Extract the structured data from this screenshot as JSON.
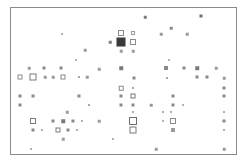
{
  "figure": {
    "type": "scatter",
    "title": "",
    "background_color": "#ffffff",
    "frame": {
      "x": 10,
      "y": 7,
      "width": 227,
      "height": 148,
      "border_color": "#8a8a8a",
      "border_width": 1,
      "fill": "#ffffff"
    },
    "marker_shape": "square",
    "palette": {
      "light": "#b9b9b9",
      "mid": "#9a9a9a",
      "dark": "#6e6e6e",
      "darkest": "#3a3a3a"
    },
    "axes": {
      "xlabel": "",
      "ylabel": "",
      "ticks_visible": false,
      "grid": false,
      "xlim": [
        0,
        227
      ],
      "ylim": [
        0,
        148
      ]
    },
    "legend": {
      "visible": false,
      "entries": []
    },
    "annotations": []
  },
  "chart_data": {
    "type": "scatter",
    "title": "",
    "xlabel": "",
    "ylabel": "",
    "xlim": [
      0,
      227
    ],
    "ylim": [
      0,
      148
    ],
    "grid": false,
    "legend_position": "none",
    "marker_shape": "square",
    "size_encodes": "magnitude",
    "note": "Grayscale square-marker scatter; marker side length encodes value, fill darkness encodes intensity. Coordinates are in plot-area pixels relative to the frame interior.",
    "points": [
      {
        "x": 134,
        "y": 9,
        "s": 2.5,
        "c": "#7a7a7a",
        "fill": "solid"
      },
      {
        "x": 190,
        "y": 8,
        "s": 3.0,
        "c": "#6e6e6e",
        "fill": "solid"
      },
      {
        "x": 160,
        "y": 20,
        "s": 2.5,
        "c": "#8a8a8a",
        "fill": "solid"
      },
      {
        "x": 51,
        "y": 26,
        "s": 2.0,
        "c": "#b0b0b0",
        "fill": "solid"
      },
      {
        "x": 110,
        "y": 25,
        "s": 6.0,
        "c": "#8a8a8a",
        "fill": "open"
      },
      {
        "x": 122,
        "y": 25,
        "s": 4.0,
        "c": "#9a9a9a",
        "fill": "open"
      },
      {
        "x": 150,
        "y": 26,
        "s": 2.5,
        "c": "#9a9a9a",
        "fill": "solid"
      },
      {
        "x": 176,
        "y": 26,
        "s": 2.5,
        "c": "#9a9a9a",
        "fill": "solid"
      },
      {
        "x": 99,
        "y": 34,
        "s": 2.5,
        "c": "#7a7a7a",
        "fill": "solid"
      },
      {
        "x": 110,
        "y": 34,
        "s": 9.0,
        "c": "#3a3a3a",
        "fill": "solid"
      },
      {
        "x": 122,
        "y": 34,
        "s": 6.0,
        "c": "#8a8a8a",
        "fill": "open"
      },
      {
        "x": 110,
        "y": 43,
        "s": 2.5,
        "c": "#9a9a9a",
        "fill": "solid"
      },
      {
        "x": 122,
        "y": 43,
        "s": 2.5,
        "c": "#9a9a9a",
        "fill": "solid"
      },
      {
        "x": 74,
        "y": 42,
        "s": 2.5,
        "c": "#9a9a9a",
        "fill": "solid"
      },
      {
        "x": 65,
        "y": 52,
        "s": 2.0,
        "c": "#b0b0b0",
        "fill": "solid"
      },
      {
        "x": 158,
        "y": 52,
        "s": 2.0,
        "c": "#b0b0b0",
        "fill": "solid"
      },
      {
        "x": 18,
        "y": 60,
        "s": 2.5,
        "c": "#9a9a9a",
        "fill": "solid"
      },
      {
        "x": 33,
        "y": 60,
        "s": 3.0,
        "c": "#8a8a8a",
        "fill": "solid"
      },
      {
        "x": 50,
        "y": 60,
        "s": 3.0,
        "c": "#8a8a8a",
        "fill": "solid"
      },
      {
        "x": 88,
        "y": 61,
        "s": 2.5,
        "c": "#9a9a9a",
        "fill": "solid"
      },
      {
        "x": 110,
        "y": 60,
        "s": 3.5,
        "c": "#7a7a7a",
        "fill": "solid"
      },
      {
        "x": 155,
        "y": 60,
        "s": 4.0,
        "c": "#8a8a8a",
        "fill": "solid"
      },
      {
        "x": 173,
        "y": 60,
        "s": 3.0,
        "c": "#8a8a8a",
        "fill": "solid"
      },
      {
        "x": 186,
        "y": 60,
        "s": 3.5,
        "c": "#7a7a7a",
        "fill": "solid"
      },
      {
        "x": 205,
        "y": 60,
        "s": 2.5,
        "c": "#9a9a9a",
        "fill": "solid"
      },
      {
        "x": 9,
        "y": 69,
        "s": 5.0,
        "c": "#8a8a8a",
        "fill": "open"
      },
      {
        "x": 22,
        "y": 69,
        "s": 7.0,
        "c": "#7a7a7a",
        "fill": "open"
      },
      {
        "x": 34,
        "y": 69,
        "s": 2.5,
        "c": "#9a9a9a",
        "fill": "solid"
      },
      {
        "x": 42,
        "y": 69,
        "s": 2.5,
        "c": "#9a9a9a",
        "fill": "solid"
      },
      {
        "x": 52,
        "y": 69,
        "s": 5.0,
        "c": "#8a8a8a",
        "fill": "open"
      },
      {
        "x": 68,
        "y": 69,
        "s": 2.0,
        "c": "#a8a8a8",
        "fill": "solid"
      },
      {
        "x": 76,
        "y": 69,
        "s": 2.5,
        "c": "#9a9a9a",
        "fill": "solid"
      },
      {
        "x": 123,
        "y": 70,
        "s": 3.0,
        "c": "#8a8a8a",
        "fill": "solid"
      },
      {
        "x": 156,
        "y": 70,
        "s": 2.0,
        "c": "#a8a8a8",
        "fill": "solid"
      },
      {
        "x": 186,
        "y": 69,
        "s": 3.0,
        "c": "#8a8a8a",
        "fill": "solid"
      },
      {
        "x": 196,
        "y": 69,
        "s": 3.0,
        "c": "#8a8a8a",
        "fill": "solid"
      },
      {
        "x": 213,
        "y": 70,
        "s": 2.5,
        "c": "#9a9a9a",
        "fill": "solid"
      },
      {
        "x": 110,
        "y": 80,
        "s": 4.5,
        "c": "#8a8a8a",
        "fill": "open"
      },
      {
        "x": 122,
        "y": 80,
        "s": 2.0,
        "c": "#a8a8a8",
        "fill": "solid"
      },
      {
        "x": 213,
        "y": 80,
        "s": 3.0,
        "c": "#8a8a8a",
        "fill": "solid"
      },
      {
        "x": 9,
        "y": 88,
        "s": 3.0,
        "c": "#8a8a8a",
        "fill": "solid"
      },
      {
        "x": 22,
        "y": 88,
        "s": 3.0,
        "c": "#8a8a8a",
        "fill": "solid"
      },
      {
        "x": 68,
        "y": 88,
        "s": 3.0,
        "c": "#8a8a8a",
        "fill": "solid"
      },
      {
        "x": 110,
        "y": 88,
        "s": 3.0,
        "c": "#8a8a8a",
        "fill": "solid"
      },
      {
        "x": 122,
        "y": 88,
        "s": 5.0,
        "c": "#7a7a7a",
        "fill": "open"
      },
      {
        "x": 162,
        "y": 88,
        "s": 3.0,
        "c": "#8a8a8a",
        "fill": "solid"
      },
      {
        "x": 213,
        "y": 88,
        "s": 3.0,
        "c": "#8a8a8a",
        "fill": "solid"
      },
      {
        "x": 9,
        "y": 97,
        "s": 3.0,
        "c": "#8a8a8a",
        "fill": "solid"
      },
      {
        "x": 78,
        "y": 97,
        "s": 2.0,
        "c": "#a8a8a8",
        "fill": "solid"
      },
      {
        "x": 110,
        "y": 97,
        "s": 3.0,
        "c": "#8a8a8a",
        "fill": "solid"
      },
      {
        "x": 122,
        "y": 97,
        "s": 3.0,
        "c": "#8a8a8a",
        "fill": "solid"
      },
      {
        "x": 140,
        "y": 97,
        "s": 2.5,
        "c": "#9a9a9a",
        "fill": "solid"
      },
      {
        "x": 162,
        "y": 97,
        "s": 3.0,
        "c": "#8a8a8a",
        "fill": "solid"
      },
      {
        "x": 172,
        "y": 97,
        "s": 2.0,
        "c": "#b0b0b0",
        "fill": "solid"
      },
      {
        "x": 56,
        "y": 104,
        "s": 2.5,
        "c": "#9a9a9a",
        "fill": "solid"
      },
      {
        "x": 122,
        "y": 104,
        "s": 2.0,
        "c": "#b0b0b0",
        "fill": "solid"
      },
      {
        "x": 152,
        "y": 104,
        "s": 2.0,
        "c": "#b0b0b0",
        "fill": "solid"
      },
      {
        "x": 160,
        "y": 104,
        "s": 2.0,
        "c": "#b0b0b0",
        "fill": "solid"
      },
      {
        "x": 213,
        "y": 104,
        "s": 2.0,
        "c": "#b0b0b0",
        "fill": "solid"
      },
      {
        "x": 22,
        "y": 113,
        "s": 6.0,
        "c": "#7a7a7a",
        "fill": "open"
      },
      {
        "x": 42,
        "y": 113,
        "s": 3.0,
        "c": "#8a8a8a",
        "fill": "solid"
      },
      {
        "x": 52,
        "y": 113,
        "s": 3.5,
        "c": "#7a7a7a",
        "fill": "solid"
      },
      {
        "x": 62,
        "y": 113,
        "s": 3.0,
        "c": "#8a8a8a",
        "fill": "solid"
      },
      {
        "x": 71,
        "y": 113,
        "s": 2.0,
        "c": "#b0b0b0",
        "fill": "solid"
      },
      {
        "x": 88,
        "y": 113,
        "s": 2.5,
        "c": "#9a9a9a",
        "fill": "solid"
      },
      {
        "x": 122,
        "y": 113,
        "s": 8.0,
        "c": "#6e6e6e",
        "fill": "open"
      },
      {
        "x": 152,
        "y": 113,
        "s": 2.0,
        "c": "#b0b0b0",
        "fill": "solid"
      },
      {
        "x": 162,
        "y": 113,
        "s": 6.0,
        "c": "#8a8a8a",
        "fill": "open"
      },
      {
        "x": 213,
        "y": 113,
        "s": 3.0,
        "c": "#8a8a8a",
        "fill": "solid"
      },
      {
        "x": 22,
        "y": 122,
        "s": 3.0,
        "c": "#8a8a8a",
        "fill": "solid"
      },
      {
        "x": 31,
        "y": 122,
        "s": 2.0,
        "c": "#b0b0b0",
        "fill": "solid"
      },
      {
        "x": 47,
        "y": 122,
        "s": 5.0,
        "c": "#7a7a7a",
        "fill": "open"
      },
      {
        "x": 57,
        "y": 122,
        "s": 3.0,
        "c": "#8a8a8a",
        "fill": "solid"
      },
      {
        "x": 66,
        "y": 122,
        "s": 2.0,
        "c": "#b0b0b0",
        "fill": "solid"
      },
      {
        "x": 122,
        "y": 122,
        "s": 7.0,
        "c": "#7a7a7a",
        "fill": "open"
      },
      {
        "x": 162,
        "y": 122,
        "s": 4.0,
        "c": "#9a9a9a",
        "fill": "solid"
      },
      {
        "x": 213,
        "y": 122,
        "s": 2.0,
        "c": "#b0b0b0",
        "fill": "solid"
      },
      {
        "x": 52,
        "y": 131,
        "s": 2.5,
        "c": "#9a9a9a",
        "fill": "solid"
      },
      {
        "x": 102,
        "y": 131,
        "s": 2.0,
        "c": "#b0b0b0",
        "fill": "solid"
      },
      {
        "x": 20,
        "y": 141,
        "s": 2.0,
        "c": "#b0b0b0",
        "fill": "solid"
      },
      {
        "x": 145,
        "y": 141,
        "s": 2.5,
        "c": "#9a9a9a",
        "fill": "solid"
      },
      {
        "x": 213,
        "y": 141,
        "s": 2.5,
        "c": "#9a9a9a",
        "fill": "solid"
      }
    ]
  }
}
